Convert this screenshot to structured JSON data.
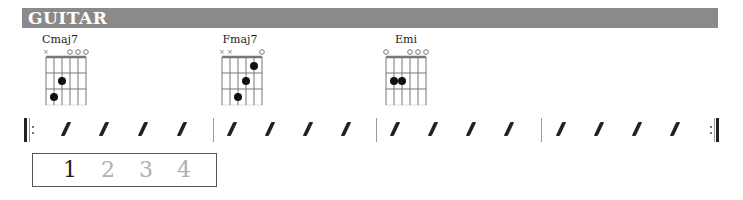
{
  "header": {
    "title": "GUITAR",
    "bg_color": "#8a8a8a"
  },
  "chords": [
    {
      "name": "Cmaj7",
      "markers": [
        "x",
        "",
        "",
        "o",
        "o",
        "o"
      ],
      "frets": [
        null,
        3,
        2,
        0,
        0,
        0
      ]
    },
    {
      "name": "Fmaj7",
      "markers": [
        "x",
        "x",
        "",
        "",
        "",
        "o"
      ],
      "frets": [
        null,
        null,
        3,
        2,
        1,
        0
      ]
    },
    {
      "name": "Emi",
      "markers": [
        "o",
        "",
        "",
        "o",
        "o",
        "o"
      ],
      "frets": [
        0,
        2,
        2,
        0,
        0,
        0
      ]
    }
  ],
  "rhythm": {
    "measures": 4,
    "beats_per_measure": 4,
    "notation": "slash",
    "repeat_start": true,
    "repeat_end": true
  },
  "counter": {
    "beats": [
      "1",
      "2",
      "3",
      "4"
    ],
    "active_beat": "1",
    "active_color": "#222222",
    "inactive_color": "#b0b0b0"
  }
}
